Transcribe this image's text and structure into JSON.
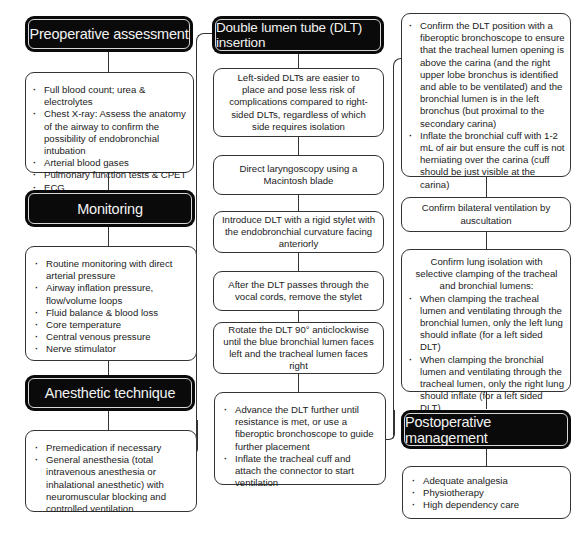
{
  "columns": {
    "left": {
      "preoperative": {
        "title": "Preoperative assessment",
        "items": [
          "Full blood count; urea & electrolytes",
          "Chest X-ray: Assess the anatomy of the airway to confirm the possibility of endobronchial intubation",
          "Arterial blood gases",
          "Pulmonary function tests & CPET",
          "ECG"
        ]
      },
      "monitoring": {
        "title": "Monitoring",
        "items": [
          "Routine monitoring with direct arterial pressure",
          "Airway inflation pressure, flow/volume loops",
          "Fluid balance & blood loss",
          "Core temperature",
          "Central venous pressure",
          "Nerve stimulator"
        ]
      },
      "anesthetic": {
        "title": "Anesthetic technique",
        "items": [
          "Premedication if necessary",
          "General anesthesia (total intravenous anesthesia or inhalational anesthetic) with neuromuscular blocking and controlled ventilation"
        ]
      }
    },
    "middle": {
      "title": "Double lumen tube (DLT) insertion",
      "steps": [
        "Left-sided DLTs are easier to place and pose less risk of complications compared to right-sided DLTs, regardless of which side requires isolation",
        "Direct laryngoscopy using a Macintosh blade",
        "Introduce DLT with a rigid stylet with the endobronchial curvature facing anteriorly",
        "After the DLT passes through the vocal cords, remove the stylet",
        "Rotate the DLT 90° anticlockwise until the blue bronchial lumen faces left and the tracheal lumen faces right"
      ],
      "final_items": [
        "Advance the DLT further until resistance is met, or use a fiberoptic bronchoscope to guide further placement",
        "Inflate the tracheal cuff and attach the connector to start ventilation"
      ]
    },
    "right": {
      "confirm_position_items": [
        "Confirm the DLT position with a fiberoptic bronchoscope to ensure that the tracheal lumen opening is above the carina (and the right upper lobe bronchus is identified and able to be ventilated) and the bronchial lumen is in the left bronchus (but proximal to the secondary carina)",
        "Inflate the bronchial cuff with 1-2 mL of air but ensure the cuff is not herniating over the carina (cuff should be just visible at the carina)"
      ],
      "bilateral": "Confirm bilateral ventilation by auscultation",
      "isolation": {
        "intro": "Confirm lung isolation with selective clamping of the tracheal and bronchial lumens:",
        "items": [
          "When clamping the tracheal lumen and ventilating through the bronchial lumen, only the left lung should inflate (for a left sided DLT)",
          "When clamping the bronchial lumen and ventilating through the tracheal lumen, only the right lung should inflate (for a left sided DLT)"
        ]
      },
      "postoperative": {
        "title": "Postoperative management",
        "items": [
          "Adequate analgesia",
          "Physiotherapy",
          "High dependency care"
        ]
      }
    }
  }
}
